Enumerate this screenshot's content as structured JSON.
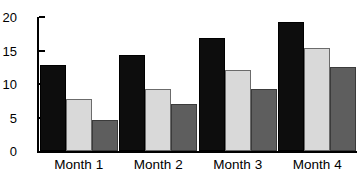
{
  "chart_data": {
    "type": "bar",
    "title": "",
    "subtitle": "",
    "xlabel": "",
    "ylabel": "",
    "categories": [
      "Month 1",
      "Month 2",
      "Month 3",
      "Month 4"
    ],
    "series": [
      {
        "name": "Series 1",
        "color": "#0d0d0d",
        "values": [
          12.8,
          14.3,
          16.8,
          19.3
        ]
      },
      {
        "name": "Series 2",
        "color": "#d9d9d9",
        "values": [
          7.7,
          9.3,
          12.1,
          15.4
        ]
      },
      {
        "name": "Series 3",
        "color": "#5e5e5e",
        "values": [
          4.6,
          7.0,
          9.3,
          12.6
        ]
      }
    ],
    "ylim": [
      0,
      20
    ],
    "yticks": [
      0,
      5,
      10,
      15,
      20
    ],
    "ytick_labels": [
      "0",
      "5",
      "10",
      "15",
      "20"
    ],
    "grid": false,
    "legend": "none",
    "background_color": "#ffffff",
    "axis_color": "#000000"
  }
}
